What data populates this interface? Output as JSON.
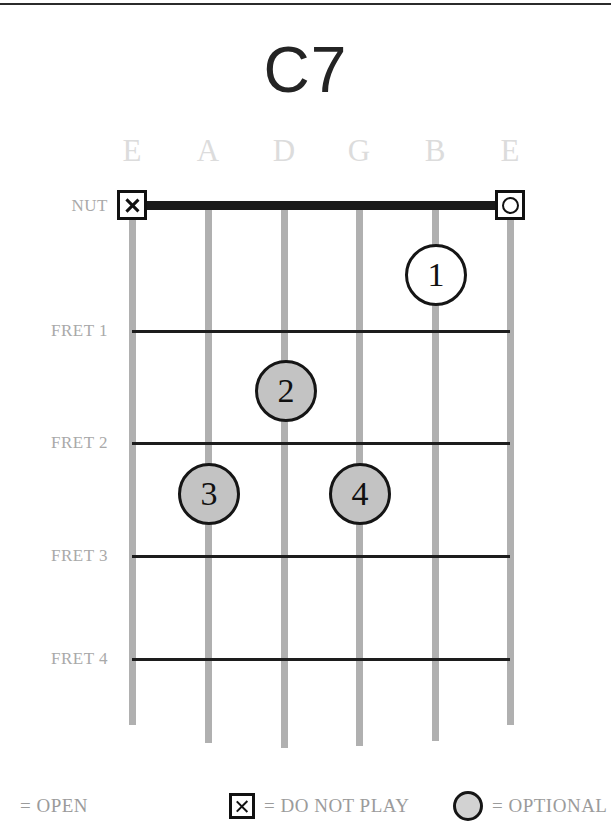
{
  "chord": {
    "name": "C7",
    "nut_label": "NUT",
    "strings": [
      {
        "label": "E",
        "x": 132
      },
      {
        "label": "A",
        "x": 208
      },
      {
        "label": "D",
        "x": 284
      },
      {
        "label": "G",
        "x": 359
      },
      {
        "label": "B",
        "x": 435
      },
      {
        "label": "E",
        "x": 510
      }
    ],
    "frets": [
      {
        "label": "FRET 1",
        "y": 331
      },
      {
        "label": "FRET 2",
        "y": 443
      },
      {
        "label": "FRET 3",
        "y": 556
      },
      {
        "label": "FRET 4",
        "y": 659
      }
    ],
    "nut_y": 205,
    "nut_markers": [
      {
        "type": "do-not-play",
        "glyph": "X",
        "string": 0,
        "x": 132
      },
      {
        "type": "open",
        "glyph": "O",
        "string": 5,
        "x": 510
      }
    ],
    "finger_dots": [
      {
        "finger": "1",
        "string": 4,
        "string_label": "B",
        "fret": 1,
        "style": "open",
        "x": 436,
        "y": 275
      },
      {
        "finger": "2",
        "string": 2,
        "string_label": "D",
        "fret": 2,
        "style": "filled",
        "x": 286,
        "y": 391
      },
      {
        "finger": "3",
        "string": 1,
        "string_label": "A",
        "fret": 3,
        "style": "filled",
        "x": 209,
        "y": 494
      },
      {
        "finger": "4",
        "string": 3,
        "string_label": "G",
        "fret": 3,
        "style": "filled",
        "x": 360,
        "y": 494
      }
    ]
  },
  "legend": [
    {
      "icon": "open-circle-icon",
      "text": "= OPEN",
      "left": 20
    },
    {
      "icon": "x-square-icon",
      "text": "= DO NOT PLAY",
      "left": 229
    },
    {
      "icon": "gray-circle-icon",
      "text": "= OPTIONAL",
      "left": 453
    }
  ],
  "colors": {
    "ink": "#1a1a1a",
    "string": "#b0b0b0",
    "label": "#a9a9a9",
    "string_label": "#dcdcdc",
    "dot_fill": "#c3c3c3"
  }
}
